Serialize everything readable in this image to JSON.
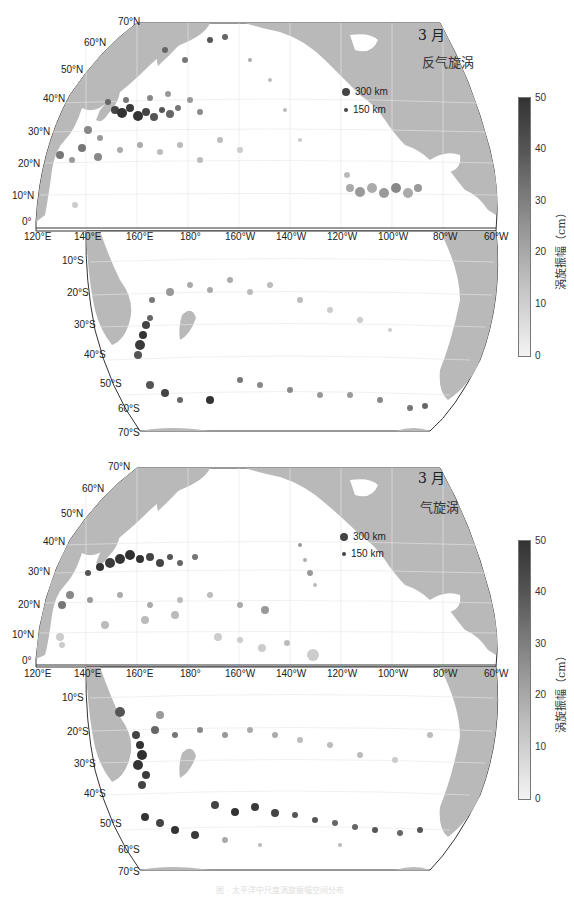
{
  "figure": {
    "caption": "图 · 太平洋中尺度涡旋振幅空间分布"
  },
  "panels": [
    {
      "id": "anticyclonic",
      "month_label": "3 月",
      "type_label": "反气旋涡",
      "legend": [
        {
          "label": "300 km",
          "size": 8
        },
        {
          "label": "150 km",
          "size": 4
        }
      ],
      "colorbar": {
        "label": "涡旋振幅（cm）",
        "ticks": [
          "50",
          "40",
          "30",
          "20",
          "10",
          "0"
        ],
        "min": 0,
        "max": 50
      }
    },
    {
      "id": "cyclonic",
      "month_label": "3 月",
      "type_label": "气旋涡",
      "legend": [
        {
          "label": "300 km",
          "size": 8
        },
        {
          "label": "150 km",
          "size": 4
        }
      ],
      "colorbar": {
        "label": "涡旋振幅（cm）",
        "ticks": [
          "50",
          "40",
          "30",
          "20",
          "10",
          "0"
        ],
        "min": 0,
        "max": 50
      }
    }
  ],
  "axes": {
    "north_lat_labels": [
      "70°N",
      "60°N",
      "50°N",
      "40°N",
      "30°N",
      "20°N",
      "10°N",
      "0°"
    ],
    "south_lat_labels": [
      "10°S",
      "20°S",
      "30°S",
      "40°S",
      "50°S",
      "60°S",
      "70°S"
    ],
    "lon_labels": [
      "120°E",
      "140°E",
      "160°E",
      "180°",
      "160°W",
      "140°W",
      "120°W",
      "100°W",
      "80°W",
      "60°W"
    ]
  },
  "colors": {
    "land": "#b9b9b9",
    "ocean": "#ffffff",
    "frame": "#333333",
    "eddy_dark": "#3a3a3a",
    "eddy_light": "#c8c8c8"
  }
}
